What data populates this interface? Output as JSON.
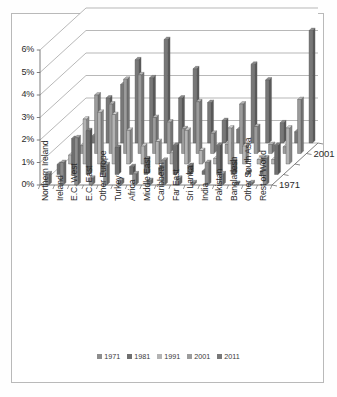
{
  "chart_data": {
    "type": "bar",
    "title": "",
    "subtitle": "",
    "xlabel": "",
    "ylabel": "",
    "zlabel": "",
    "ylim": [
      0,
      6
    ],
    "ytick_labels": [
      "0%",
      "1%",
      "2%",
      "3%",
      "4%",
      "5%",
      "6%"
    ],
    "ytick_values": [
      0,
      1,
      2,
      3,
      4,
      5,
      6
    ],
    "grid": true,
    "projection": "3d-columns",
    "legend_position": "bottom",
    "depth_axis_tick_labels": [
      "2001",
      "1971"
    ],
    "categories": [
      "Northern Ireland",
      "Ireland",
      "E.C. West",
      "E.C. East",
      "Other Europe",
      "Turkey",
      "Africa",
      "Middle East",
      "Caribbean",
      "Far East",
      "Sri Lanka",
      "India",
      "Pakistan",
      "Bangladesh",
      "Other South Asia",
      "Rest of World"
    ],
    "series": [
      {
        "name": "1971",
        "color": "#8d8d8d",
        "values": [
          0.5,
          1.0,
          2.1,
          0.3,
          0.9,
          0.2,
          0.5,
          0.2,
          1.1,
          0.3,
          0.1,
          1.0,
          0.5,
          0.05,
          0.1,
          1.2
        ]
      },
      {
        "name": "1981",
        "color": "#6f6f6f",
        "values": [
          0.45,
          1.6,
          1.95,
          0.5,
          1.2,
          0.35,
          0.7,
          0.3,
          1.3,
          0.4,
          0.15,
          1.3,
          0.6,
          0.1,
          0.15,
          1.3
        ]
      },
      {
        "name": "1991",
        "color": "#b4b4b4",
        "values": [
          0.4,
          2.0,
          2.3,
          2.2,
          1.5,
          0.8,
          1.0,
          0.5,
          1.5,
          0.6,
          0.25,
          1.6,
          0.8,
          0.2,
          0.2,
          1.6
        ]
      },
      {
        "name": "2001",
        "color": "#9c9c9c",
        "values": [
          0.35,
          2.6,
          2.2,
          3.3,
          3.5,
          1.6,
          1.4,
          1.1,
          2.3,
          0.9,
          0.4,
          2.2,
          1.2,
          0.4,
          0.3,
          2.4
        ]
      },
      {
        "name": "2011",
        "color": "#787878",
        "values": [
          0.3,
          2.0,
          2.6,
          3.7,
          2.9,
          4.6,
          2.0,
          3.3,
          1.8,
          1.0,
          0.6,
          3.5,
          2.8,
          0.9,
          0.5,
          5.0
        ]
      }
    ]
  }
}
